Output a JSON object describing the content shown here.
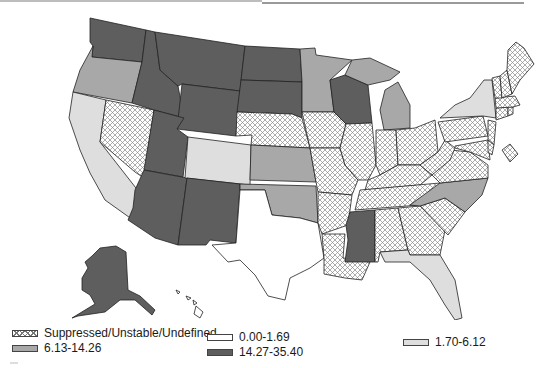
{
  "map": {
    "title": "",
    "region": "United States",
    "colors": {
      "suppressed": "hatch",
      "c0": "#ffffff",
      "c1": "#dedede",
      "c2": "#a8a8a8",
      "c3": "#5e5e5e",
      "border": "#222222"
    },
    "states": {
      "WA": "c3",
      "OR": "c2",
      "CA": "c1",
      "NV": "suppressed",
      "ID": "c3",
      "MT": "c3",
      "WY": "c3",
      "UT": "c3",
      "AZ": "c3",
      "CO": "c1",
      "NM": "c3",
      "ND": "c3",
      "SD": "c3",
      "NE": "suppressed",
      "KS": "c2",
      "OK": "c2",
      "TX": "c0",
      "MN": "c2",
      "IA": "suppressed",
      "MO": "suppressed",
      "AR": "suppressed",
      "LA": "suppressed",
      "WI": "c3",
      "IL": "suppressed",
      "MI": "c2",
      "IN": "suppressed",
      "OH": "suppressed",
      "KY": "suppressed",
      "TN": "suppressed",
      "MS": "c3",
      "AL": "suppressed",
      "GA": "suppressed",
      "FL": "c1",
      "SC": "suppressed",
      "NC": "c2",
      "VA": "suppressed",
      "WV": "suppressed",
      "PA": "suppressed",
      "NY": "c1",
      "NJ": "suppressed",
      "MD": "suppressed",
      "DE": "suppressed",
      "CT": "suppressed",
      "RI": "suppressed",
      "MA": "suppressed",
      "VT": "suppressed",
      "NH": "suppressed",
      "ME": "suppressed",
      "DC": "suppressed",
      "AK": "c3",
      "HI": "c0"
    }
  },
  "legend": {
    "items": [
      {
        "key": "suppressed",
        "label": "Suppressed/Unstable/Undefined"
      },
      {
        "key": "c0",
        "label": "0.00-1.69"
      },
      {
        "key": "c1",
        "label": "1.70-6.12"
      },
      {
        "key": "c2",
        "label": "6.13-14.26"
      },
      {
        "key": "c3",
        "label": "14.27-35.40"
      }
    ]
  }
}
